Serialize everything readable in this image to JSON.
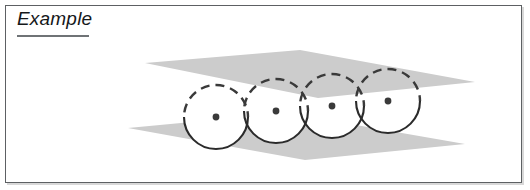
{
  "frame": {
    "border_color": "#5d6063",
    "shadow_color": "#d8d8d8",
    "background": "#ffffff"
  },
  "header": {
    "title": "Example",
    "title_style": "italic",
    "rule_color": "#6f7376"
  },
  "figure": {
    "caption": "four circles threaded between two parallel planes",
    "plane_fill": "#cccccc",
    "circle_stroke": "#2b2b2b",
    "circle_fill": "#ffffff",
    "center_dot_color": "#3a3a3a",
    "dash_pattern": "9 6",
    "top_plane": {
      "name": "upper-plane",
      "points": "145,63 300,50 475,82 318,98"
    },
    "bottom_plane": {
      "name": "lower-plane",
      "points": "128,128 287,113 465,144 305,160"
    },
    "circles": [
      {
        "label": "circle-1",
        "cx": 216,
        "cy": 117,
        "r": 32
      },
      {
        "label": "circle-2",
        "cx": 276,
        "cy": 111,
        "r": 32
      },
      {
        "label": "circle-3",
        "cx": 332,
        "cy": 106,
        "r": 32
      },
      {
        "label": "circle-4",
        "cx": 388,
        "cy": 101,
        "r": 32
      }
    ],
    "center_dot_radius": 3.4
  }
}
